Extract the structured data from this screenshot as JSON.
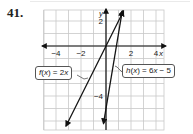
{
  "problem": {
    "number": "41."
  },
  "chart_data": {
    "type": "line",
    "title": "",
    "xlabel": "x",
    "ylabel": "y",
    "xlim": [
      -4.8,
      4.6
    ],
    "ylim": [
      -6.7,
      2.9
    ],
    "grid": true,
    "x_tick_labels": [
      "−4",
      "−2",
      "2",
      "4"
    ],
    "x_ticks": [
      -4,
      -2,
      2,
      4
    ],
    "y_tick_labels": [
      "2",
      "−4"
    ],
    "y_ticks": [
      2,
      -4
    ],
    "series": [
      {
        "name": "f(x) = 2x",
        "slope": 2,
        "intercept": 0,
        "x": [
          -3.2,
          1.4
        ],
        "y": [
          -6.4,
          2.8
        ]
      },
      {
        "name": "h(x) = 6x − 5",
        "slope": 6,
        "intercept": -5,
        "x": [
          -0.2,
          1.3
        ],
        "y": [
          -6.2,
          2.8
        ]
      }
    ],
    "annotations": [
      {
        "text": "f(x) = 2x",
        "target": "f"
      },
      {
        "text": "h(x) = 6x − 5",
        "target": "h"
      }
    ]
  },
  "labels": {
    "x_axis": "x",
    "y_axis": "y",
    "f_callout_name": "f",
    "f_callout_rest": " = 2",
    "h_callout_name": "h",
    "h_callout_rest": " = 6",
    "h_callout_tail": " − 5"
  }
}
